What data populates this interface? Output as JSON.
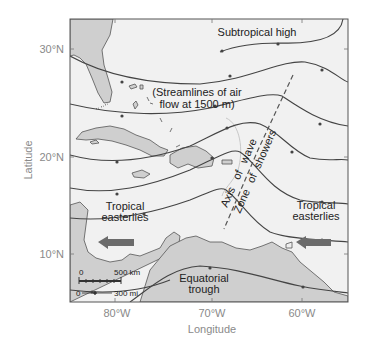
{
  "figure": {
    "axis_labels": {
      "x": "Longitude",
      "y": "Latitude"
    },
    "lat_ticks": [
      "30°N",
      "20°N",
      "10°N"
    ],
    "lon_ticks": [
      "80°W",
      "70°W",
      "60°W"
    ],
    "labels": {
      "subtropical_high": "Subtropical high",
      "streamlines_line1": "(Streamlines of air",
      "streamlines_line2": "flow at 1500 m)",
      "tropical_easterlies_left_1": "Tropical",
      "tropical_easterlies_left_2": "easterlies",
      "tropical_easterlies_right_1": "Tropical",
      "tropical_easterlies_right_2": "easterlies",
      "equatorial_trough_1": "Equatorial",
      "equatorial_trough_2": "trough",
      "axis_word1": "Axis",
      "axis_word2": "of",
      "axis_word3": "wave",
      "zone_word1": "Zone",
      "zone_word2": "of",
      "zone_word3": "showers"
    },
    "scale_bar": {
      "km_start": "0",
      "km_label": "500 km",
      "mi_start": "0",
      "mi_label": "300 mi"
    },
    "colors": {
      "ocean": "#f1f1f1",
      "land": "#cfcfcf",
      "streamline": "#444444",
      "arrow": "#6b6b6b",
      "axis_text": "#8a8a8a"
    }
  }
}
